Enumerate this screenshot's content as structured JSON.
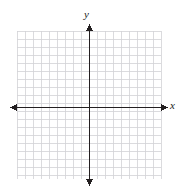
{
  "figure": {
    "kind": "coordinate-plane",
    "background_color": "#ffffff",
    "grid_color": "#d2d2d6",
    "axis_color": "#231f20",
    "label_color": "#1a1a1a"
  },
  "labels": {
    "x_axis": "x",
    "y_axis": "y"
  },
  "chart_data": {
    "type": "scatter",
    "title": "",
    "subtitle": "",
    "xlabel": "x",
    "ylabel": "y",
    "xlim": [
      -9,
      9
    ],
    "ylim": [
      -9,
      9
    ],
    "x_major_step": 1,
    "y_major_step": 1,
    "grid": true,
    "grid_columns": 18,
    "grid_rows": 18,
    "grid_cell_px": 8,
    "axes": {
      "x_axis_at_y": 0,
      "y_axis_at_x": 0,
      "arrowheads": [
        "left",
        "right",
        "up",
        "down"
      ],
      "tick_labels_x": [],
      "tick_labels_y": []
    },
    "legend": null,
    "legend_position": "none",
    "annotations": [],
    "series": [],
    "x": [],
    "values": []
  },
  "geometry": {
    "grid_left_px": 17,
    "grid_right_px": 161,
    "grid_top_px": 31,
    "grid_bottom_px": 179,
    "origin_x_px": 89,
    "origin_y_px": 107,
    "cell_px": 8,
    "axis_stroke_px": 1.9,
    "grid_stroke_px": 0.8,
    "x_arrow_left_px": 10,
    "x_arrow_right_px": 168,
    "y_arrow_top_px": 24,
    "y_arrow_bottom_px": 186
  }
}
